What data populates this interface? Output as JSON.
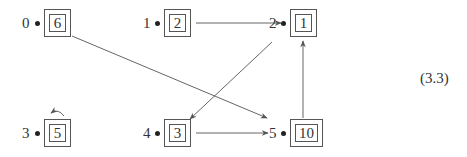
{
  "diagram": {
    "type": "directed-graph",
    "equation_label": "(3.3)",
    "nodes": [
      {
        "id": "0",
        "label": "0",
        "value": "6",
        "x": 44,
        "y": 9,
        "w": 27,
        "h": 28
      },
      {
        "id": "1",
        "label": "1",
        "value": "2",
        "x": 164,
        "y": 9,
        "w": 27,
        "h": 28
      },
      {
        "id": "2",
        "label": "2",
        "value": "1",
        "x": 290,
        "y": 9,
        "w": 27,
        "h": 28
      },
      {
        "id": "3",
        "label": "3",
        "value": "5",
        "x": 44,
        "y": 119,
        "w": 27,
        "h": 28
      },
      {
        "id": "4",
        "label": "4",
        "value": "3",
        "x": 164,
        "y": 119,
        "w": 27,
        "h": 28
      },
      {
        "id": "5",
        "label": "5",
        "value": "10",
        "x": 290,
        "y": 119,
        "w": 33,
        "h": 28
      }
    ],
    "edges": [
      {
        "from": "1",
        "to": "2"
      },
      {
        "from": "2",
        "to": "4"
      },
      {
        "from": "0",
        "to": "5"
      },
      {
        "from": "4",
        "to": "5"
      },
      {
        "from": "5",
        "to": "2"
      },
      {
        "from": "3",
        "to": "3",
        "type": "self-loop"
      }
    ],
    "colors": {
      "stroke": "#555555",
      "text": "#333333",
      "background": "#ffffff"
    }
  }
}
